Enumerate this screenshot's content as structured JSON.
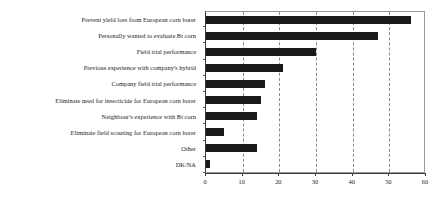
{
  "chart_data": {
    "type": "bar",
    "orientation": "horizontal",
    "title": "",
    "subtitle": "",
    "xlabel": "",
    "ylabel": "",
    "xlim": [
      0,
      60
    ],
    "xticks": [
      0,
      10,
      20,
      30,
      40,
      50,
      60
    ],
    "xticklabels": [
      "0",
      "10",
      "20",
      "30",
      "40",
      "50",
      "60"
    ],
    "grid": true,
    "grid_axis": "x",
    "grid_style": "dashed",
    "legend": null,
    "bar_color": "#1a1a1a",
    "categories": [
      "Prevent yield loss from European corn borer",
      "Personally wanted to evaluate Bt corn",
      "Field trial performance",
      "Previous experience with company's hybrid",
      "Company field trial performance",
      "Eliminate need for insecticide for European corn borer",
      "Neighbour's experience with Bt corn",
      "Eliminate field scouting for European corn borer",
      "Other",
      "DK/NA"
    ],
    "values": [
      56,
      47,
      30,
      21,
      16,
      15,
      14,
      5,
      14,
      1
    ]
  }
}
